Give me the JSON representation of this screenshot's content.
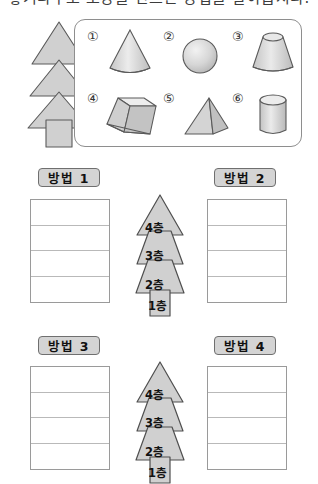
{
  "heading": {
    "text": "쌓기나무로 모양을 만드는 방법을 알아봅시다."
  },
  "shapes_panel": {
    "items": [
      {
        "number": "①",
        "icon": "cone-icon",
        "name": "cone"
      },
      {
        "number": "②",
        "icon": "sphere-icon",
        "name": "sphere"
      },
      {
        "number": "③",
        "icon": "truncated-cone-icon",
        "name": "truncated-cone"
      },
      {
        "number": "④",
        "icon": "truncated-prism-icon",
        "name": "truncated-prism"
      },
      {
        "number": "⑤",
        "icon": "pyramid-icon",
        "name": "pyramid"
      },
      {
        "number": "⑥",
        "icon": "cylinder-icon",
        "name": "cylinder"
      }
    ]
  },
  "tree_illustration": {
    "name": "layered-tree-icon"
  },
  "methods": [
    {
      "label": "방법 1",
      "rows": [
        "",
        "",
        "",
        ""
      ]
    },
    {
      "label": "방법 2",
      "rows": [
        "",
        "",
        "",
        ""
      ]
    },
    {
      "label": "방법 3",
      "rows": [
        "",
        "",
        "",
        ""
      ]
    },
    {
      "label": "방법 4",
      "rows": [
        "",
        "",
        "",
        ""
      ]
    }
  ],
  "floor_trees": [
    {
      "floors": [
        "4층",
        "3층",
        "2층",
        "1층"
      ]
    },
    {
      "floors": [
        "4층",
        "3층",
        "2층",
        "1층"
      ]
    }
  ],
  "colors": {
    "shape_fill": "#d0d0d0",
    "shape_stroke": "#5a5a5a",
    "label_fill": "#d4d4d4",
    "label_stroke": "#6f6f6f",
    "panel_stroke": "#8e8e8e",
    "table_stroke": "#9a9a9a",
    "table_rule": "#b9b9b9"
  }
}
